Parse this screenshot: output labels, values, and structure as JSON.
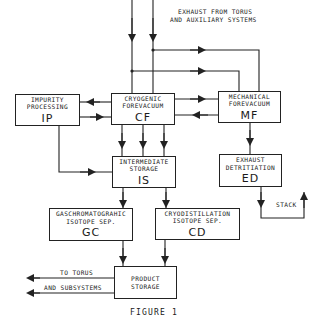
{
  "diagram": {
    "title_top": {
      "line1": "EXHAUST FROM TORUS",
      "line2": "AND AUXILIARY SYSTEMS"
    },
    "nodes": {
      "ip": {
        "line1": "IMPURITY",
        "line2": "PROCESSING",
        "abbr": "IP"
      },
      "cf": {
        "line1": "CRYOGENIC",
        "line2": "FOREVACUUM",
        "abbr": "CF"
      },
      "mf": {
        "line1": "MECHANICAL",
        "line2": "FOREVACUUM",
        "abbr": "MF"
      },
      "is": {
        "line1": "INTERMEDIATE",
        "line2": "STORAGE",
        "abbr": "IS"
      },
      "ed": {
        "line1": "EXHAUST",
        "line2": "DETRITIATION",
        "abbr": "ED"
      },
      "gc": {
        "line1": "GASCHROMATOGRAHIC",
        "line2": "ISOTOPE SEP.",
        "abbr": "GC"
      },
      "cd": {
        "line1": "CRYODISTILLATION",
        "line2": "ISOTOPE SEP.",
        "abbr": "CD"
      },
      "ps": {
        "line1": "PRODUCT",
        "line2": "STORAGE"
      }
    },
    "labels": {
      "stack": "STACK",
      "to_torus_line1": "TO TORUS",
      "to_torus_line2": "AND SUBSYSTEMS",
      "figure": "FIGURE 1"
    },
    "edges": [
      {
        "from": "torus_exhaust",
        "to": "cf"
      },
      {
        "from": "torus_exhaust",
        "to": "mf"
      },
      {
        "from": "cf",
        "to": "ip"
      },
      {
        "from": "ip",
        "to": "cf"
      },
      {
        "from": "cf",
        "to": "mf"
      },
      {
        "from": "mf",
        "to": "cf"
      },
      {
        "from": "ip",
        "to": "is"
      },
      {
        "from": "cf",
        "to": "is"
      },
      {
        "from": "mf",
        "to": "ed"
      },
      {
        "from": "ed",
        "to": "stack"
      },
      {
        "from": "is",
        "to": "gc"
      },
      {
        "from": "is",
        "to": "cd"
      },
      {
        "from": "gc",
        "to": "ps"
      },
      {
        "from": "cd",
        "to": "ps"
      },
      {
        "from": "ps",
        "to": "torus_and_subsystems"
      }
    ],
    "colors": {
      "line": "#222222",
      "background": "#ffffff"
    }
  }
}
